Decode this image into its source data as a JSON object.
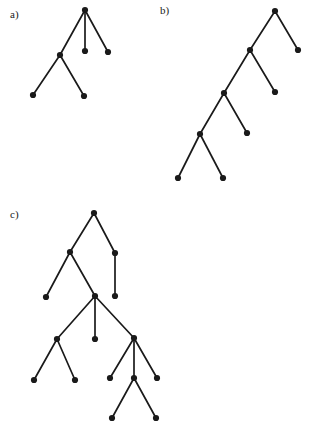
{
  "figure": {
    "title": "",
    "background_color": "#ffffff",
    "ink_color": "#1a1a1a",
    "width": 310,
    "height": 433,
    "node_radius": 3.1,
    "edge_width": 1.7
  },
  "panels": [
    {
      "id": "a",
      "label": "a)",
      "label_x": 10,
      "label_y": 18,
      "node_count": 6,
      "edge_count": 5,
      "nodes": [
        {
          "id": "a0",
          "x": 85,
          "y": 10,
          "role": "root"
        },
        {
          "id": "a1",
          "x": 60,
          "y": 55,
          "role": "internal"
        },
        {
          "id": "a2",
          "x": 85,
          "y": 51,
          "role": "leaf"
        },
        {
          "id": "a3",
          "x": 108,
          "y": 52,
          "role": "leaf"
        },
        {
          "id": "a4",
          "x": 33,
          "y": 95,
          "role": "leaf"
        },
        {
          "id": "a5",
          "x": 84,
          "y": 96,
          "role": "leaf"
        }
      ],
      "edges": [
        {
          "from": "a0",
          "to": "a1"
        },
        {
          "from": "a0",
          "to": "a2"
        },
        {
          "from": "a0",
          "to": "a3"
        },
        {
          "from": "a1",
          "to": "a4"
        },
        {
          "from": "a1",
          "to": "a5"
        }
      ]
    },
    {
      "id": "b",
      "label": "b)",
      "label_x": 160,
      "label_y": 14,
      "node_count": 9,
      "edge_count": 8,
      "nodes": [
        {
          "id": "b0",
          "x": 275,
          "y": 11,
          "role": "root"
        },
        {
          "id": "b1",
          "x": 250,
          "y": 50,
          "role": "internal"
        },
        {
          "id": "b2",
          "x": 298,
          "y": 50,
          "role": "leaf"
        },
        {
          "id": "b3",
          "x": 224,
          "y": 93,
          "role": "internal"
        },
        {
          "id": "b4",
          "x": 275,
          "y": 92,
          "role": "leaf"
        },
        {
          "id": "b5",
          "x": 200,
          "y": 134,
          "role": "internal"
        },
        {
          "id": "b6",
          "x": 247,
          "y": 133,
          "role": "leaf"
        },
        {
          "id": "b7",
          "x": 178,
          "y": 178,
          "role": "leaf"
        },
        {
          "id": "b8",
          "x": 223,
          "y": 178,
          "role": "leaf"
        }
      ],
      "edges": [
        {
          "from": "b0",
          "to": "b1"
        },
        {
          "from": "b0",
          "to": "b2"
        },
        {
          "from": "b1",
          "to": "b3"
        },
        {
          "from": "b1",
          "to": "b4"
        },
        {
          "from": "b3",
          "to": "b5"
        },
        {
          "from": "b3",
          "to": "b6"
        },
        {
          "from": "b5",
          "to": "b7"
        },
        {
          "from": "b5",
          "to": "b8"
        }
      ]
    },
    {
      "id": "c",
      "label": "c)",
      "label_x": 10,
      "label_y": 218,
      "node_count": 15,
      "edge_count": 14,
      "nodes": [
        {
          "id": "c0",
          "x": 94,
          "y": 213,
          "role": "root"
        },
        {
          "id": "c1",
          "x": 70,
          "y": 252,
          "role": "internal"
        },
        {
          "id": "c2",
          "x": 115,
          "y": 253,
          "role": "internal"
        },
        {
          "id": "c3",
          "x": 46,
          "y": 297,
          "role": "leaf"
        },
        {
          "id": "c4",
          "x": 95,
          "y": 296,
          "role": "internal"
        },
        {
          "id": "c5",
          "x": 115,
          "y": 296,
          "role": "leaf"
        },
        {
          "id": "c6",
          "x": 57,
          "y": 339,
          "role": "internal"
        },
        {
          "id": "c7",
          "x": 95,
          "y": 339,
          "role": "leaf"
        },
        {
          "id": "c8",
          "x": 134,
          "y": 338,
          "role": "internal"
        },
        {
          "id": "c9",
          "x": 34,
          "y": 380,
          "role": "leaf"
        },
        {
          "id": "c10",
          "x": 75,
          "y": 380,
          "role": "leaf"
        },
        {
          "id": "c11",
          "x": 110,
          "y": 378,
          "role": "leaf"
        },
        {
          "id": "c12",
          "x": 134,
          "y": 378,
          "role": "internal"
        },
        {
          "id": "c13",
          "x": 157,
          "y": 378,
          "role": "leaf"
        },
        {
          "id": "c14",
          "x": 112,
          "y": 418,
          "role": "leaf"
        },
        {
          "id": "c15",
          "x": 156,
          "y": 418,
          "role": "leaf"
        }
      ],
      "edges": [
        {
          "from": "c0",
          "to": "c1"
        },
        {
          "from": "c0",
          "to": "c2"
        },
        {
          "from": "c1",
          "to": "c3"
        },
        {
          "from": "c1",
          "to": "c4"
        },
        {
          "from": "c2",
          "to": "c5"
        },
        {
          "from": "c4",
          "to": "c6"
        },
        {
          "from": "c4",
          "to": "c7"
        },
        {
          "from": "c4",
          "to": "c8"
        },
        {
          "from": "c6",
          "to": "c9"
        },
        {
          "from": "c6",
          "to": "c10"
        },
        {
          "from": "c8",
          "to": "c11"
        },
        {
          "from": "c8",
          "to": "c12"
        },
        {
          "from": "c8",
          "to": "c13"
        },
        {
          "from": "c12",
          "to": "c14"
        },
        {
          "from": "c12",
          "to": "c15"
        }
      ]
    }
  ]
}
